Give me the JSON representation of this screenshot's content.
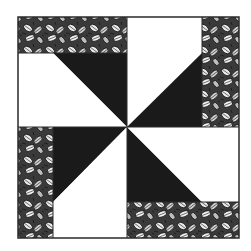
{
  "figure": {
    "colors": {
      "background": "#ffffff",
      "dark": "#1a1a1a",
      "light": "#ffffff",
      "outline": "#2a2a2a",
      "leaf_base": "#3a3a3a",
      "leaf_light": "#e8e8e8"
    },
    "block": {
      "x": 18,
      "y": 17,
      "size": 221,
      "center": [
        127,
        127
      ],
      "strip_width": 36
    },
    "quadrants": [
      {
        "position": "top-left",
        "strip_side": "top",
        "dark_triangle": "upper-right",
        "light_triangle": "lower-left"
      },
      {
        "position": "top-right",
        "strip_side": "right",
        "dark_triangle": "lower-left",
        "light_triangle": "upper-right"
      },
      {
        "position": "bottom-left",
        "strip_side": "left",
        "dark_triangle": "upper-right",
        "light_triangle": "lower-left"
      },
      {
        "position": "bottom-right",
        "strip_side": "bottom",
        "dark_triangle": "lower-left",
        "light_triangle": "upper-right"
      }
    ]
  }
}
